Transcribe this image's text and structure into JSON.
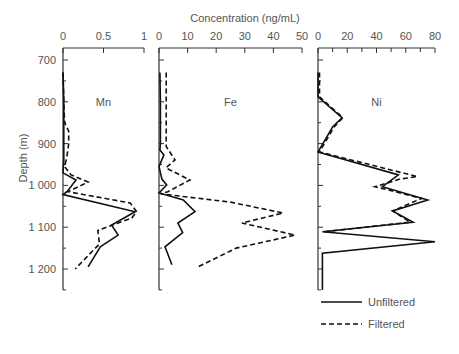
{
  "chart_data": {
    "type": "line",
    "title": "Concentration  (ng/mL)",
    "ylabel": "Depth  (m)",
    "y_ticks": [
      700,
      800,
      900,
      1000,
      1100,
      1200
    ],
    "y_tick_labels": [
      "700",
      "800",
      "900",
      "1 000",
      "1 100",
      "1 200"
    ],
    "ylim": [
      1250,
      685
    ],
    "legend": [
      {
        "name": "Unfiltered",
        "style": "solid"
      },
      {
        "name": "Filtered",
        "style": "dashed"
      }
    ],
    "panels": [
      {
        "label": "Mn",
        "xlim": [
          0,
          1
        ],
        "x_ticks": [
          0,
          0.5,
          1
        ],
        "x_tick_labels": [
          "0",
          "0.5",
          "1"
        ],
        "series": [
          {
            "name": "Unfiltered",
            "points": [
              [
                730,
                0
              ],
              [
                800,
                0.01
              ],
              [
                850,
                0.01
              ],
              [
                900,
                0.01
              ],
              [
                940,
                0.01
              ],
              [
                970,
                0
              ],
              [
                987,
                0.16
              ],
              [
                1015,
                0.05
              ],
              [
                1022,
                0
              ],
              [
                1063,
                0.89
              ],
              [
                1095,
                0.6
              ],
              [
                1119,
                0.68
              ],
              [
                1147,
                0.46
              ],
              [
                1195,
                0.31
              ]
            ]
          },
          {
            "name": "Filtered",
            "points": [
              [
                730,
                0
              ],
              [
                800,
                0.01
              ],
              [
                850,
                0.02
              ],
              [
                870,
                0.07
              ],
              [
                900,
                0.07
              ],
              [
                930,
                0.05
              ],
              [
                955,
                0.02
              ],
              [
                975,
                0.1
              ],
              [
                992,
                0.31
              ],
              [
                1015,
                0.06
              ],
              [
                1042,
                0.83
              ],
              [
                1063,
                0.91
              ],
              [
                1078,
                0.85
              ],
              [
                1108,
                0.43
              ],
              [
                1140,
                0.45
              ],
              [
                1200,
                0.15
              ]
            ]
          }
        ]
      },
      {
        "label": "Fe",
        "xlim": [
          0,
          50
        ],
        "x_ticks": [
          0,
          10,
          20,
          30,
          40,
          50
        ],
        "x_tick_labels": [
          "0",
          "10",
          "20",
          "30",
          "40",
          "50"
        ],
        "series": [
          {
            "name": "Unfiltered",
            "points": [
              [
                730,
                0.3
              ],
              [
                800,
                0.5
              ],
              [
                900,
                0.5
              ],
              [
                915,
                0.3
              ],
              [
                927,
                1.7
              ],
              [
                955,
                0
              ],
              [
                985,
                1
              ],
              [
                999,
                2.7
              ],
              [
                1018,
                0
              ],
              [
                1035,
                8.5
              ],
              [
                1063,
                12.6
              ],
              [
                1090,
                6.6
              ],
              [
                1113,
                8.3
              ],
              [
                1147,
                2.1
              ],
              [
                1190,
                4.5
              ]
            ]
          },
          {
            "name": "Filtered",
            "points": [
              [
                730,
                2.5
              ],
              [
                800,
                2.5
              ],
              [
                907,
                2.5
              ],
              [
                939,
                5.6
              ],
              [
                958,
                2.4
              ],
              [
                987,
                10.8
              ],
              [
                1015,
                3.1
              ],
              [
                1020,
                0.5
              ],
              [
                1040,
                25
              ],
              [
                1066,
                43.4
              ],
              [
                1090,
                29
              ],
              [
                1119,
                47.6
              ],
              [
                1150,
                27
              ],
              [
                1195,
                13.6
              ]
            ]
          }
        ]
      },
      {
        "label": "Ni",
        "xlim": [
          0,
          80
        ],
        "x_ticks": [
          0,
          20,
          40,
          60,
          80
        ],
        "x_tick_labels": [
          "0",
          "20",
          "40",
          "60",
          "80"
        ],
        "series": [
          {
            "name": "Unfiltered",
            "points": [
              [
                730,
                0
              ],
              [
                788,
                0
              ],
              [
                838,
                16.4
              ],
              [
                860,
                10
              ],
              [
                920,
                0
              ],
              [
                975,
                55
              ],
              [
                1003,
                44
              ],
              [
                1035,
                75
              ],
              [
                1061,
                51
              ],
              [
                1088,
                65
              ],
              [
                1111,
                3
              ],
              [
                1135,
                80
              ],
              [
                1162,
                3
              ],
              [
                1250,
                3
              ]
            ]
          },
          {
            "name": "Filtered",
            "points": [
              [
                730,
                1
              ],
              [
                788,
                1
              ],
              [
                838,
                17
              ],
              [
                860,
                11
              ],
              [
                920,
                1
              ],
              [
                979,
                68
              ],
              [
                985,
                56
              ],
              [
                1003,
                39
              ],
              [
                1031,
                71
              ],
              [
                1061,
                51
              ],
              [
                1088,
                63
              ],
              [
                1111,
                4
              ]
            ]
          }
        ]
      }
    ]
  }
}
